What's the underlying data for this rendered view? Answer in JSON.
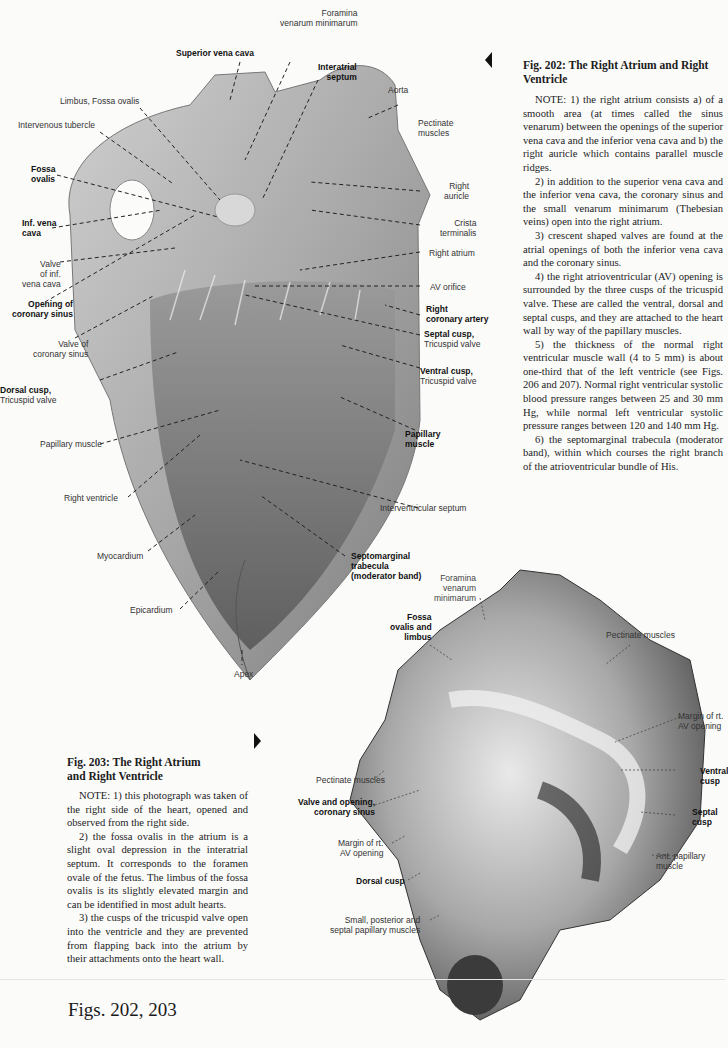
{
  "figure_202": {
    "title": "Fig. 202: The Right Atrium and Right Ventricle",
    "notes": [
      "NOTE: 1) the right atrium consists a) of a smooth area (at times called the sinus venarum) between the openings of the superior vena cava and the inferior vena cava and b) the right auricle which contains parallel muscle ridges.",
      "2) in addition to the superior vena cava and the inferior vena cava, the coronary sinus and the small venarum minimarum (Thebesian veins) open into the right atrium.",
      "3) crescent shaped valves are found at the atrial openings of both the inferior vena cava and the coronary sinus.",
      "4) the right atrioventricular (AV) opening is surrounded by the three cusps of the tricuspid valve. These are called the ventral, dorsal and septal cusps, and they are attached to the heart wall by way of the papillary muscles.",
      "5) the thickness of the normal right ventricular muscle wall (4 to 5 mm) is about one-third that of the left ventricle (see Figs. 206 and 207). Normal right ventricular systolic blood pressure ranges between 25 and 30 mm Hg, while normal left ventricular systolic pressure ranges between 120 and 140 mm Hg.",
      "6) the septomarginal trabecula (moderator band), within which courses the right branch of the atrioventricular bundle of His."
    ],
    "labels": {
      "superior_vena_cava": "Superior vena cava",
      "foramina_1": "Foramina",
      "foramina_2": "venarum minimarum",
      "interatrial_1": "Interatrial",
      "interatrial_2": "septum",
      "aorta": "Aorta",
      "limbus": "Limbus, Fossa ovalis",
      "intervenous": "Intervenous tubercle",
      "pectinate_1": "Pectinate",
      "pectinate_2": "muscles",
      "fossa_1": "Fossa",
      "fossa_2": "ovalis",
      "right_auricle_1": "Right",
      "right_auricle_2": "auricle",
      "inf_vc_1": "Inf. vena",
      "inf_vc_2": "cava",
      "crista_1": "Crista",
      "crista_2": "terminalis",
      "valve_ivc_1": "Valve",
      "valve_ivc_2": "of inf.",
      "valve_ivc_3": "vena cava",
      "right_atrium": "Right atrium",
      "opening_cs_1": "Opening of",
      "opening_cs_2": "coronary sinus",
      "av_orifice": "AV orifice",
      "right_coronary_1": "Right",
      "right_coronary_2": "coronary artery",
      "valve_cs_1": "Valve of",
      "valve_cs_2": "coronary sinus",
      "septal_cusp_1": "Septal cusp,",
      "septal_cusp_2": "Tricuspid valve",
      "ventral_cusp_1": "Ventral cusp,",
      "ventral_cusp_2": "Tricuspid valve",
      "dorsal_cusp_1": "Dorsal cusp,",
      "dorsal_cusp_2": "Tricuspid valve",
      "papillary_left": "Papillary muscle",
      "papillary_right_1": "Papillary",
      "papillary_right_2": "muscle",
      "right_ventricle": "Right ventricle",
      "interventricular": "Interventricular septum",
      "myocardium": "Myocardium",
      "septomarginal_1": "Septomarginal",
      "septomarginal_2": "trabecula",
      "septomarginal_3": "(moderator band)",
      "epicardium": "Epicardium",
      "apex": "Apex"
    }
  },
  "figure_203": {
    "title_line1": "Fig. 203: The Right Atrium",
    "title_line2": "and Right Ventricle",
    "notes": [
      "NOTE: 1) this photograph was taken of the right side of the heart, opened and observed from the right side.",
      "2) the fossa ovalis in the atrium is a slight oval depression in the interatrial septum. It corresponds to the foramen ovale of the fetus. The limbus of the fossa ovalis is its slightly elevated margin and can be identified in most adult hearts.",
      "3) the cusps of the tricuspid valve open into the ventricle and they are prevented from flapping back into the atrium by their attachments onto the heart wall."
    ],
    "labels": {
      "foramina_1": "Foramina",
      "foramina_2": "venarum",
      "foramina_3": "minimarum",
      "fossa_1": "Fossa",
      "fossa_2": "ovalis and",
      "fossa_3": "limbus",
      "pectinate_top": "Pectinate muscles",
      "margin_rt_1": "Margin of rt.",
      "margin_rt_2": "AV opening",
      "ventral_1": "Ventral",
      "ventral_2": "cusp",
      "pectinate_left": "Pectinate muscles",
      "valve_opening_1": "Valve and opening,",
      "valve_opening_2": "coronary sinus",
      "septal_1": "Septal",
      "septal_2": "cusp",
      "margin_left_1": "Margin of rt.",
      "margin_left_2": "AV opening",
      "ant_pap_1": "Ant. papillary",
      "ant_pap_2": "muscle",
      "dorsal": "Dorsal cusp",
      "small_1": "Small, posterior and",
      "small_2": "septal papillary muscles"
    }
  },
  "footer": {
    "figs_label": "Figs. 202, 203"
  }
}
